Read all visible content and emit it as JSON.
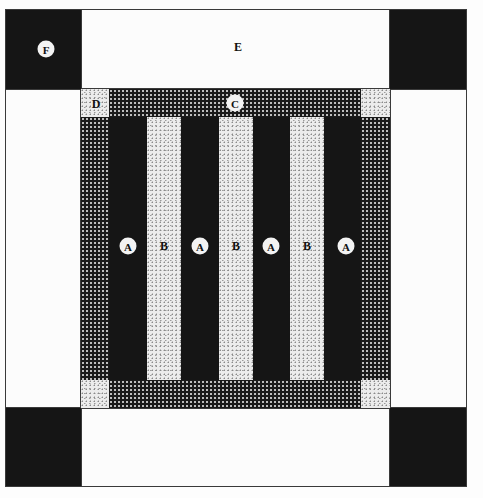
{
  "diagram": {
    "type": "quilt-block-layout",
    "colors": {
      "dark": "#151515",
      "light": "#fcfcfc",
      "hatch_bg": "#1a1a1a",
      "speckle_bg": "#ececec",
      "outline": "#3a3a3a"
    },
    "labels": {
      "corner_block": "F",
      "side_panel": "E",
      "border_band": "C",
      "cornerstone": "D",
      "dark_strip": "A",
      "light_strip": "B"
    },
    "strips": [
      {
        "label": "A",
        "fill": "dark"
      },
      {
        "label": "B",
        "fill": "light-speckle"
      },
      {
        "label": "A",
        "fill": "dark"
      },
      {
        "label": "B",
        "fill": "light-speckle"
      },
      {
        "label": "A",
        "fill": "dark"
      },
      {
        "label": "B",
        "fill": "light-speckle"
      },
      {
        "label": "A",
        "fill": "dark"
      }
    ]
  }
}
